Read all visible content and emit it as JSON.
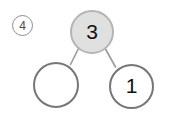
{
  "figure": {
    "panel_tag": "4",
    "panel_tag_shape": "circled-number",
    "background_color": "#ffffff"
  },
  "tree": {
    "type": "binary-tree",
    "nodes": [
      {
        "id": "root",
        "label": "3",
        "role": "root",
        "fill": "#e0e0e0",
        "stroke": "#b4b4b4",
        "highlighted": true,
        "empty": false
      },
      {
        "id": "left-child",
        "label": "",
        "role": "left-child",
        "fill": "#ffffff",
        "stroke": "#767676",
        "highlighted": false,
        "empty": true
      },
      {
        "id": "right-child",
        "label": "1",
        "role": "right-child",
        "fill": "#ffffff",
        "stroke": "#767676",
        "highlighted": false,
        "empty": false
      }
    ],
    "edges": [
      {
        "from": "root",
        "to": "left-child",
        "color": "#9a9a9a"
      },
      {
        "from": "root",
        "to": "right-child",
        "color": "#9a9a9a"
      }
    ]
  }
}
